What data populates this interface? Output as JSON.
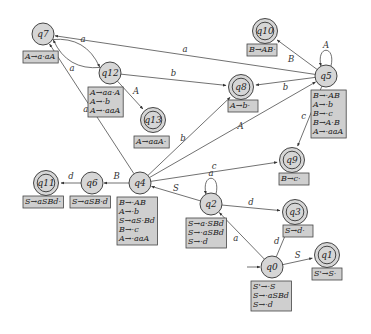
{
  "diagram": {
    "type": "LR parser automaton",
    "states": [
      {
        "id": "q0",
        "label": "q0",
        "x": 272,
        "y": 267,
        "accept": false,
        "start": true,
        "items": [
          "S'→·S",
          "S→·aSBd",
          "S→·d"
        ],
        "box": {
          "x": 251,
          "y": 281
        }
      },
      {
        "id": "q1",
        "label": "q1",
        "x": 327,
        "y": 255,
        "accept": true,
        "items": [
          "S'→S·"
        ],
        "box": {
          "x": 312,
          "y": 268
        }
      },
      {
        "id": "q2",
        "label": "q2",
        "x": 211,
        "y": 204,
        "accept": false,
        "items": [
          "S→a·SBd",
          "S→·aSBd",
          "S→·d"
        ],
        "box": {
          "x": 186,
          "y": 218
        }
      },
      {
        "id": "q3",
        "label": "q3",
        "x": 295,
        "y": 212,
        "accept": true,
        "items": [
          "S→d·"
        ],
        "box": {
          "x": 283,
          "y": 225
        }
      },
      {
        "id": "q4",
        "label": "q4",
        "x": 140,
        "y": 183,
        "accept": false,
        "items": [
          "B→·AB",
          "A→·b",
          "S→aS·Bd",
          "B→·c",
          "A→·aaA"
        ],
        "box": {
          "x": 117,
          "y": 197
        }
      },
      {
        "id": "q5",
        "label": "q5",
        "x": 326,
        "y": 76,
        "accept": false,
        "items": [
          "B→·AB",
          "A→·b",
          "B→·c",
          "B→A·B",
          "A→·aaA"
        ],
        "box": {
          "x": 311,
          "y": 90
        }
      },
      {
        "id": "q6",
        "label": "q6",
        "x": 92,
        "y": 183,
        "accept": false,
        "items": [
          "S→aSB·d"
        ],
        "box": {
          "x": 70,
          "y": 196
        }
      },
      {
        "id": "q7",
        "label": "q7",
        "x": 43,
        "y": 34,
        "accept": false,
        "items": [
          "A→a·aA"
        ],
        "box": {
          "x": 23,
          "y": 51
        }
      },
      {
        "id": "q8",
        "label": "q8",
        "x": 241,
        "y": 87,
        "accept": true,
        "items": [
          "A→b·"
        ],
        "box": {
          "x": 228,
          "y": 100
        }
      },
      {
        "id": "q9",
        "label": "q9",
        "x": 292,
        "y": 160,
        "accept": true,
        "items": [
          "B→c·"
        ],
        "box": {
          "x": 279,
          "y": 173
        }
      },
      {
        "id": "q10",
        "label": "q10",
        "x": 265,
        "y": 31,
        "accept": true,
        "items": [
          "B→AB·"
        ],
        "box": {
          "x": 247,
          "y": 44
        }
      },
      {
        "id": "q11",
        "label": "q11",
        "x": 46,
        "y": 183,
        "accept": true,
        "items": [
          "S→aSBd·"
        ],
        "box": {
          "x": 23,
          "y": 196
        }
      },
      {
        "id": "q12",
        "label": "q12",
        "x": 110,
        "y": 73,
        "accept": false,
        "items": [
          "A→aa·A",
          "A→·b",
          "A→·aaA"
        ],
        "box": {
          "x": 88,
          "y": 87
        }
      },
      {
        "id": "q13",
        "label": "q13",
        "x": 153,
        "y": 120,
        "accept": true,
        "items": [
          "A→aaA·"
        ],
        "box": {
          "x": 134,
          "y": 136
        }
      }
    ],
    "transitions": [
      {
        "from": "q0",
        "to": "q1",
        "symbol": "S"
      },
      {
        "from": "q0",
        "to": "q2",
        "symbol": "a"
      },
      {
        "from": "q0",
        "to": "q3",
        "symbol": "d"
      },
      {
        "from": "q2",
        "to": "q2",
        "symbol": "a"
      },
      {
        "from": "q2",
        "to": "q3",
        "symbol": "d"
      },
      {
        "from": "q2",
        "to": "q4",
        "symbol": "S"
      },
      {
        "from": "q4",
        "to": "q6",
        "symbol": "B"
      },
      {
        "from": "q4",
        "to": "q5",
        "symbol": "A"
      },
      {
        "from": "q4",
        "to": "q8",
        "symbol": "b"
      },
      {
        "from": "q4",
        "to": "q9",
        "symbol": "c"
      },
      {
        "from": "q4",
        "to": "q7",
        "symbol": "a"
      },
      {
        "from": "q6",
        "to": "q11",
        "symbol": "d"
      },
      {
        "from": "q5",
        "to": "q5",
        "symbol": "A"
      },
      {
        "from": "q5",
        "to": "q10",
        "symbol": "B"
      },
      {
        "from": "q5",
        "to": "q8",
        "symbol": "b"
      },
      {
        "from": "q5",
        "to": "q9",
        "symbol": "c"
      },
      {
        "from": "q5",
        "to": "q7",
        "symbol": "a"
      },
      {
        "from": "q7",
        "to": "q12",
        "symbol": "a"
      },
      {
        "from": "q12",
        "to": "q7",
        "symbol": "a"
      },
      {
        "from": "q12",
        "to": "q8",
        "symbol": "b"
      },
      {
        "from": "q12",
        "to": "q13",
        "symbol": "A"
      }
    ]
  }
}
